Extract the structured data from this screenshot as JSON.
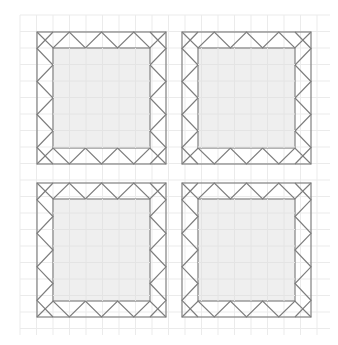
{
  "diagram": {
    "canvas": {
      "width": 338,
      "height": 345
    },
    "grid": {
      "x0": 20,
      "y0": 15,
      "x1": 330,
      "y1": 335,
      "spacing": 16.5,
      "color": "#ebebeb"
    },
    "colors": {
      "frame": "#8a8a8a",
      "zigzag": "#7d7d7d",
      "inner_fill": "#efefef",
      "background": "#ffffff"
    },
    "border_width": 16,
    "triangles_per_side": 4,
    "blocks": [
      {
        "id": "top-left",
        "x": 37,
        "y": 32,
        "w": 129,
        "h": 132
      },
      {
        "id": "top-right",
        "x": 182,
        "y": 32,
        "w": 129,
        "h": 132
      },
      {
        "id": "bottom-left",
        "x": 37,
        "y": 183,
        "w": 129,
        "h": 134
      },
      {
        "id": "bottom-right",
        "x": 182,
        "y": 183,
        "w": 129,
        "h": 134
      }
    ]
  }
}
